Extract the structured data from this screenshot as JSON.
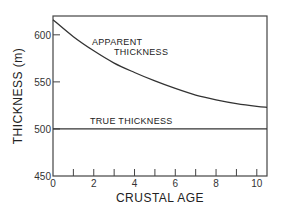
{
  "chart_data": {
    "type": "line",
    "title": "",
    "xlabel": "CRUSTAL AGE",
    "ylabel": "THICKNESS (m)",
    "xlim": [
      0,
      10.5
    ],
    "ylim": [
      450,
      620
    ],
    "xticks": [
      0,
      2,
      4,
      6,
      8,
      10
    ],
    "xminor_ticks": [
      1,
      3,
      5,
      7,
      9
    ],
    "yticks": [
      450,
      500,
      550,
      600
    ],
    "grid": false,
    "legend": "none",
    "series": [
      {
        "name": "APPARENT THICKNESS",
        "x": [
          0,
          1,
          2,
          3,
          4,
          5,
          6,
          7,
          8,
          9,
          10,
          10.5
        ],
        "y": [
          616,
          598,
          583,
          570,
          560,
          551,
          543,
          536,
          531,
          527,
          524,
          523
        ]
      },
      {
        "name": "TRUE THICKNESS",
        "x": [
          0,
          10.5
        ],
        "y": [
          500,
          500
        ]
      }
    ],
    "annotations": [
      {
        "text_line1": "APPARENT",
        "text_line2": "THICKNESS"
      },
      {
        "text": "TRUE THICKNESS"
      }
    ]
  }
}
